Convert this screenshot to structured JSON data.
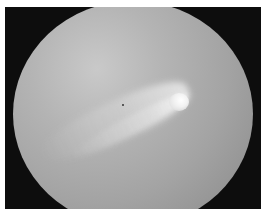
{
  "image": {
    "description": "Comet with bright head and curved tail seen through a circular telescope field of view",
    "colors": {
      "background_frame": "#0d0d0d",
      "field": "#a8a8a8",
      "comet_head": "#ffffff"
    }
  }
}
